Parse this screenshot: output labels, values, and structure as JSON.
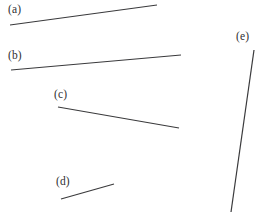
{
  "figure": {
    "name": "line-segments-figure",
    "background_color": "#ffffff",
    "stroke_color": "#3a3a3c",
    "text_color": "#2f2f31",
    "width": 257,
    "height": 212
  },
  "chart_data": {
    "type": "scatter",
    "title": "",
    "xlabel": "",
    "ylabel": "",
    "grid": false,
    "legend": "none",
    "xlim": [
      0,
      257
    ],
    "ylim": [
      212,
      0
    ],
    "series": [
      {
        "name": "(a)",
        "label": "(a)",
        "x": [
          10,
          157
        ],
        "y": [
          25,
          5
        ],
        "label_x": 8,
        "label_y": 3,
        "stroke_width": 1.2
      },
      {
        "name": "(b)",
        "label": "(b)",
        "x": [
          11,
          181
        ],
        "y": [
          70,
          55
        ],
        "label_x": 8,
        "label_y": 49,
        "stroke_width": 1.2
      },
      {
        "name": "(c)",
        "label": "(c)",
        "x": [
          58,
          179
        ],
        "y": [
          107,
          128
        ],
        "label_x": 54,
        "label_y": 88,
        "stroke_width": 1.2
      },
      {
        "name": "(d)",
        "label": "(d)",
        "x": [
          61,
          114
        ],
        "y": [
          199,
          184
        ],
        "label_x": 56,
        "label_y": 175,
        "stroke_width": 1.2
      },
      {
        "name": "(e)",
        "label": "(e)",
        "x": [
          254,
          231
        ],
        "y": [
          50,
          212
        ],
        "label_x": 236,
        "label_y": 30,
        "stroke_width": 1.2
      }
    ]
  }
}
